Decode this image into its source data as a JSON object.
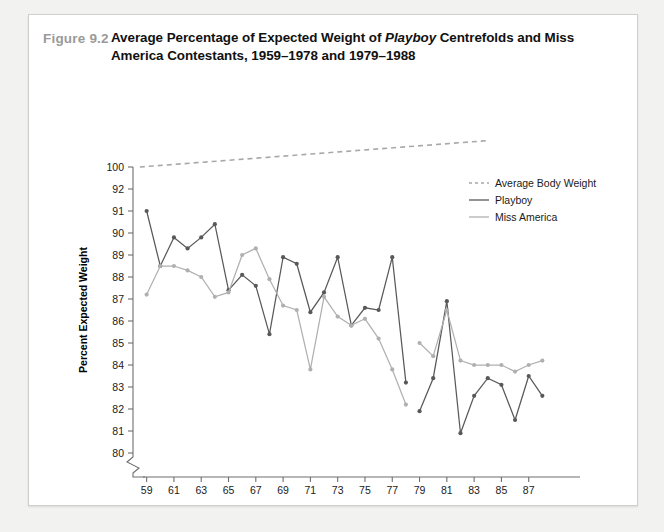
{
  "figure": {
    "number": "Figure 9.2",
    "title_part1": "Average Percentage of Expected Weight of ",
    "title_italic": "Playboy",
    "title_part2": " Centrefolds and Miss America Contestants, 1959–1978 and 1979–1988"
  },
  "chart_data": {
    "type": "line",
    "title": "Average Percentage of Expected Weight of Playboy Centrefolds and Miss America Contestants, 1959–1978 and 1979–1988",
    "xlabel": "Year",
    "ylabel": "Percent Expected Weight",
    "grid": false,
    "legend_position": "top-right",
    "ylim": [
      80,
      100
    ],
    "y_axis_broken": true,
    "y_break_between": [
      92,
      100
    ],
    "y_ticks": [
      100,
      92,
      91,
      90,
      89,
      88,
      87,
      86,
      85,
      84,
      83,
      82,
      81,
      80
    ],
    "x_ticks": [
      59,
      61,
      63,
      65,
      67,
      69,
      71,
      73,
      75,
      77,
      79,
      81,
      83,
      85,
      87
    ],
    "x_tick_labels": [
      "59",
      "61",
      "63",
      "65",
      "67",
      "69",
      "71",
      "73",
      "75",
      "77",
      "79",
      "81",
      "83",
      "85",
      "87"
    ],
    "xlim": [
      58,
      89
    ],
    "colors": {
      "playboy": "#595959",
      "miss_america": "#b0b0b0",
      "average_body_weight": "#a8a8a8",
      "axis": "#6e6e6e",
      "figure_number": "#9a9a9a"
    },
    "series": [
      {
        "name": "Average Body Weight",
        "style": "dashed",
        "color": "#a8a8a8",
        "markers": false,
        "note": "reference trend line drawn above the plotted scale, rising left to right",
        "x": [
          58.5,
          84.0
        ],
        "y": [
          100.0,
          109.6
        ]
      },
      {
        "name": "Playboy",
        "style": "solid",
        "color": "#595959",
        "markers": true,
        "segments": [
          {
            "label": "1959–1978",
            "x": [
              59,
              60,
              61,
              62,
              63,
              64,
              65,
              66,
              67,
              68,
              69,
              70,
              71,
              72,
              73,
              74,
              75,
              76,
              77,
              78
            ],
            "y": [
              91.0,
              88.5,
              89.8,
              89.3,
              89.8,
              90.4,
              87.4,
              88.1,
              87.6,
              85.4,
              88.9,
              88.6,
              86.4,
              87.3,
              88.9,
              85.8,
              86.6,
              86.5,
              88.9,
              83.2
            ]
          },
          {
            "label": "1979–1988",
            "x": [
              79,
              80,
              81,
              82,
              83,
              84,
              85,
              86,
              87,
              88
            ],
            "y": [
              81.9,
              83.4,
              86.9,
              80.9,
              82.6,
              83.4,
              83.1,
              81.5,
              83.5,
              82.6
            ]
          }
        ]
      },
      {
        "name": "Miss America",
        "style": "solid",
        "color": "#b0b0b0",
        "markers": true,
        "segments": [
          {
            "label": "1959–1978",
            "x": [
              59,
              60,
              61,
              62,
              63,
              64,
              65,
              66,
              67,
              68,
              69,
              70,
              71,
              72,
              73,
              74,
              75,
              76,
              77,
              78
            ],
            "y": [
              87.2,
              88.5,
              88.5,
              88.3,
              88.0,
              87.1,
              87.3,
              89.0,
              89.3,
              87.9,
              86.7,
              86.5,
              83.8,
              87.1,
              86.2,
              85.8,
              86.1,
              85.2,
              83.8,
              82.2
            ]
          },
          {
            "label": "1979–1988",
            "x": [
              79,
              80,
              81,
              82,
              83,
              84,
              85,
              86,
              87,
              88
            ],
            "y": [
              85.0,
              84.4,
              86.5,
              84.2,
              84.0,
              84.0,
              84.0,
              83.7,
              84.0,
              84.2
            ]
          }
        ]
      }
    ],
    "legend": [
      {
        "label": "Average Body Weight",
        "style": "dashed",
        "color": "#a8a8a8"
      },
      {
        "label": "Playboy",
        "style": "solid",
        "color": "#595959"
      },
      {
        "label": "Miss America",
        "style": "solid",
        "color": "#b0b0b0"
      }
    ]
  }
}
